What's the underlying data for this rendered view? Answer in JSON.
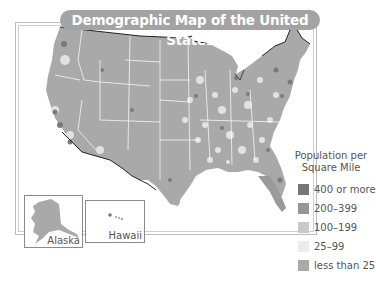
{
  "title": "Demographic Map of the United States",
  "insets": {
    "alaska": "Alaska",
    "hawaii": "Hawaii"
  },
  "legend": {
    "title_line1": "Population per",
    "title_line2": "Square Mile",
    "items": [
      {
        "label": "400 or more",
        "color": "#767676"
      },
      {
        "label": "200–399",
        "color": "#969696"
      },
      {
        "label": "100–199",
        "color": "#c9c9c9"
      },
      {
        "label": "25–99",
        "color": "#ececec"
      },
      {
        "label": "less than 25",
        "color": "#a9a9a9"
      }
    ]
  },
  "colors": {
    "land": "#a9a9a9",
    "dense": "#8a8a8a",
    "light": "#ececec",
    "border": "#ffffff",
    "coast": "#222222"
  }
}
